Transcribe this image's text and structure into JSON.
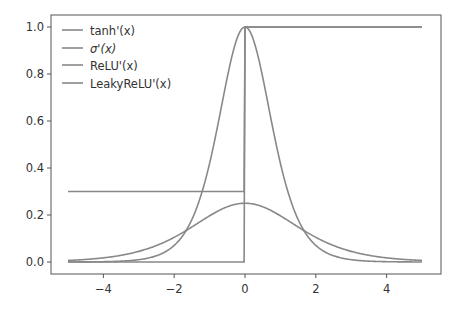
{
  "chart_data": {
    "type": "line",
    "title": "",
    "xlabel": "",
    "ylabel": "",
    "xlim": [
      -5.5,
      5.5
    ],
    "ylim": [
      -0.05,
      1.05
    ],
    "x_ticks": [
      -4,
      -2,
      0,
      2,
      4
    ],
    "x_tick_labels": [
      "−4",
      "−2",
      "0",
      "2",
      "4"
    ],
    "y_ticks": [
      0.0,
      0.2,
      0.4,
      0.6,
      0.8,
      1.0
    ],
    "y_tick_labels": [
      "0.0",
      "0.2",
      "0.4",
      "0.6",
      "0.8",
      "1.0"
    ],
    "grid": false,
    "legend_position": "upper left",
    "x_range": [
      -5,
      5
    ],
    "series": [
      {
        "name": "tanh'(x)",
        "formula": "1 - tanh(x)^2",
        "color": "#888888"
      },
      {
        "name": "σ'(x)",
        "formula": "sigmoid(x)*(1-sigmoid(x))",
        "color": "#888888"
      },
      {
        "name": "ReLU'(x)",
        "formula": "x<0 ? 0 : 1",
        "color": "#888888"
      },
      {
        "name": "LeakyReLU'(x)",
        "formula": "x<0 ? 0.3 : 1",
        "color": "#888888"
      }
    ],
    "sample_points": {
      "x": [
        -5,
        -4,
        -3,
        -2,
        -1,
        0,
        1,
        2,
        3,
        4,
        5
      ],
      "tanh_prime": [
        0.0002,
        0.0013,
        0.0099,
        0.0707,
        0.42,
        1.0,
        0.42,
        0.0707,
        0.0099,
        0.0013,
        0.0002
      ],
      "sigmoid_prime": [
        0.0066,
        0.0177,
        0.0452,
        0.105,
        0.1966,
        0.25,
        0.1966,
        0.105,
        0.0452,
        0.0177,
        0.0066
      ],
      "relu_prime": [
        0,
        0,
        0,
        0,
        0,
        1,
        1,
        1,
        1,
        1,
        1
      ],
      "leaky_relu_prime": [
        0.3,
        0.3,
        0.3,
        0.3,
        0.3,
        1,
        1,
        1,
        1,
        1,
        1
      ]
    }
  },
  "legend": {
    "items": [
      {
        "label": "tanh'(x)"
      },
      {
        "label": "σ'(x)"
      },
      {
        "label": "ReLU'(x)"
      },
      {
        "label": "LeakyReLU'(x)"
      }
    ]
  }
}
